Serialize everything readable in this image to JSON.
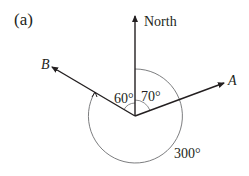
{
  "figure": {
    "label": "(a)",
    "north_label": "North",
    "point_a_label": "A",
    "point_b_label": "B",
    "angle_north_to_a": "70°",
    "angle_b_to_north": "60°",
    "reflex_angle": "300°",
    "line_color": "#231f20",
    "arc_color": "#6d6e71"
  }
}
